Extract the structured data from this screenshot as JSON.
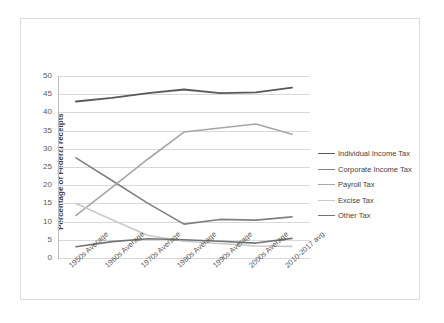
{
  "chart_data": {
    "type": "line",
    "title": "",
    "xlabel": "",
    "ylabel": "Percentage of Federal receipts",
    "ylim": [
      0,
      50
    ],
    "ytick_step": 5,
    "grid": true,
    "legend_position": "right",
    "yticks": [
      "50",
      "45",
      "40",
      "35",
      "30",
      "25",
      "20",
      "15",
      "10",
      "5",
      "0"
    ],
    "categories": [
      "1950s Average",
      "1960s Average",
      "1970s Average",
      "1980s Average",
      "1990s Average",
      "2000s Average",
      "2010-2017 avg."
    ],
    "series": [
      {
        "name": "Individual Income Tax",
        "color": "#595959",
        "width": 1.9,
        "values": [
          43.0,
          44.0,
          45.3,
          46.3,
          45.3,
          45.5,
          46.8
        ]
      },
      {
        "name": "Corporate Income Tax",
        "color": "#808080",
        "width": 1.6,
        "values": [
          27.5,
          21.3,
          15.0,
          9.3,
          10.6,
          10.4,
          11.3
        ]
      },
      {
        "name": "Payroll Tax",
        "color": "#a6a6a6",
        "width": 1.6,
        "values": [
          11.7,
          19.4,
          27.2,
          34.6,
          35.7,
          36.8,
          34.0
        ]
      },
      {
        "name": "Excise Tax",
        "color": "#c9c9c9",
        "width": 1.6,
        "values": [
          15.0,
          10.5,
          6.2,
          4.6,
          4.0,
          3.3,
          3.2
        ]
      },
      {
        "name": "Other Tax",
        "color": "#737373",
        "width": 1.6,
        "values": [
          3.1,
          4.5,
          5.3,
          5.0,
          4.6,
          4.1,
          5.4
        ]
      }
    ]
  }
}
